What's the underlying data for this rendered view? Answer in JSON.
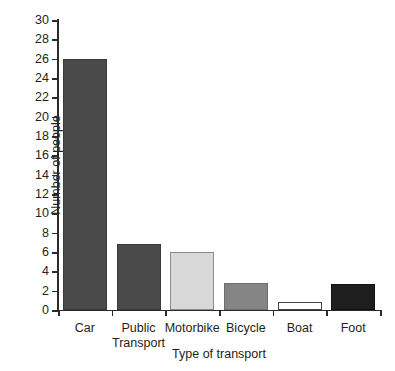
{
  "chart_data": {
    "type": "bar",
    "title": "",
    "xlabel": "Type of transport",
    "ylabel": "Number of people",
    "categories": [
      "Car",
      "Public Transport",
      "Motorbike",
      "Bicycle",
      "Boat",
      "Foot"
    ],
    "category_labels": [
      "Car",
      "Public\nTransport",
      "Motorbike",
      "Bicycle",
      "Boat",
      "Foot"
    ],
    "values": [
      26,
      6.8,
      6,
      2.8,
      0.8,
      2.7
    ],
    "ylim": [
      0,
      30
    ],
    "ytick_step": 2,
    "yticks": [
      0,
      2,
      4,
      6,
      8,
      10,
      12,
      14,
      16,
      18,
      20,
      22,
      24,
      26,
      28,
      30
    ],
    "ytick_labels": [
      "0",
      "2",
      "4",
      "6",
      "8",
      "10",
      "12",
      "14",
      "16",
      "18",
      "20",
      "22",
      "24",
      "26",
      "28",
      "30"
    ],
    "grid": false,
    "legend": false,
    "bar_colors": [
      "#4a4a4a",
      "#4a4a4a",
      "#d8d8d8",
      "#858585",
      "#ffffff",
      "#1e1e1e"
    ],
    "bar_edge_colors": [
      "#3a3a3a",
      "#3a3a3a",
      "#8a8a8a",
      "#6e6e6e",
      "#444444",
      "#111111"
    ],
    "axis_color": "#2b2b2b",
    "background": "#ffffff"
  }
}
